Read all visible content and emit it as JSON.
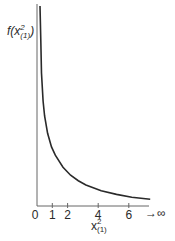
{
  "chart_data": {
    "type": "line",
    "title": "",
    "xlabel": "x²(1)",
    "ylabel": "f(x²(1))",
    "x_ticks": [
      "0",
      "1",
      "2",
      "4",
      "6"
    ],
    "x_tick_values": [
      0,
      1,
      2,
      4,
      6
    ],
    "x_end_annotation": "→ ∞",
    "xlim": [
      0,
      7.2
    ],
    "grid": false,
    "legend": null,
    "series": [
      {
        "name": "chi-square density, 1 df",
        "x": [
          0.05,
          0.1,
          0.2,
          0.3,
          0.5,
          0.75,
          1.0,
          1.5,
          2.0,
          2.5,
          3.0,
          4.0,
          5.0,
          6.0,
          7.2
        ],
        "y": [
          1.73,
          1.2,
          0.81,
          0.63,
          0.44,
          0.31,
          0.24,
          0.15,
          0.1,
          0.07,
          0.05,
          0.027,
          0.015,
          0.008,
          0.004
        ]
      }
    ],
    "colors": {
      "curve": "#2a2a2a",
      "axes": "#555555"
    }
  },
  "labels": {
    "ylabel_main": "f(x",
    "ylabel_sup": "2",
    "ylabel_sub": "(1)",
    "ylabel_close": ")",
    "xlabel_main": "x",
    "xlabel_sup": "2",
    "xlabel_sub": "(1)",
    "infinity": "→∞"
  }
}
